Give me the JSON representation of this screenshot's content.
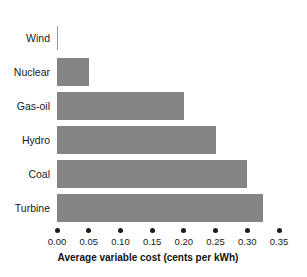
{
  "chart_data": {
    "type": "bar",
    "orientation": "horizontal",
    "title": "",
    "xlabel": "Average variable cost (cents per kWh)",
    "ylabel": "",
    "categories": [
      "Wind",
      "Nuclear",
      "Gas-oil",
      "Hydro",
      "Coal",
      "Turbine"
    ],
    "values": [
      0.0,
      0.05,
      0.2,
      0.25,
      0.3,
      0.325
    ],
    "xlim": [
      0.0,
      0.35
    ],
    "xticks": [
      0.0,
      0.05,
      0.1,
      0.15,
      0.2,
      0.25,
      0.3,
      0.35
    ],
    "xtick_labels": [
      "0.00",
      "0.05",
      "0.10",
      "0.15",
      "0.20",
      "0.25",
      "0.30",
      "0.35"
    ],
    "grid": false,
    "legend": null,
    "bar_color": "#848484",
    "background_color": "#ffffff",
    "text_color": "#1a1a1a",
    "bars": [
      {
        "label": "Wind",
        "value": 0.0
      },
      {
        "label": "Nuclear",
        "value": 0.05
      },
      {
        "label": "Gas-oil",
        "value": 0.2
      },
      {
        "label": "Hydro",
        "value": 0.25
      },
      {
        "label": "Coal",
        "value": 0.3
      },
      {
        "label": "Turbine",
        "value": 0.325
      }
    ]
  }
}
